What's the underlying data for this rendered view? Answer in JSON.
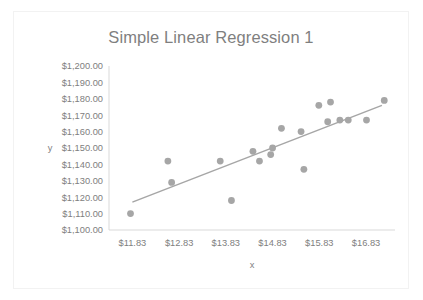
{
  "chart_data": {
    "type": "scatter",
    "title": "Simple Linear Regression 1",
    "xlabel": "x",
    "ylabel": "y",
    "xlim": [
      11.33,
      17.45
    ],
    "ylim": [
      1100,
      1200
    ],
    "grid": false,
    "legend": null,
    "x_tick_labels": [
      "$11.83",
      "$12.83",
      "$13.83",
      "$14.83",
      "$15.83",
      "$16.83"
    ],
    "x_tick_values": [
      11.83,
      12.83,
      13.83,
      14.83,
      15.83,
      16.83
    ],
    "y_tick_labels": [
      "$1,200.00",
      "$1,190.00",
      "$1,180.00",
      "$1,170.00",
      "$1,160.00",
      "$1,150.00",
      "$1,140.00",
      "$1,130.00",
      "$1,120.00",
      "$1,110.00",
      "$1,100.00"
    ],
    "y_tick_values": [
      1200,
      1190,
      1180,
      1170,
      1160,
      1150,
      1140,
      1130,
      1120,
      1110,
      1100
    ],
    "series": [
      {
        "name": "y",
        "marker_color": "#a6a6a6",
        "points": [
          {
            "x": 11.79,
            "y": 1110
          },
          {
            "x": 12.59,
            "y": 1142
          },
          {
            "x": 12.67,
            "y": 1129
          },
          {
            "x": 13.71,
            "y": 1142
          },
          {
            "x": 13.95,
            "y": 1118
          },
          {
            "x": 14.41,
            "y": 1148
          },
          {
            "x": 14.55,
            "y": 1142
          },
          {
            "x": 14.83,
            "y": 1150
          },
          {
            "x": 14.79,
            "y": 1146
          },
          {
            "x": 15.02,
            "y": 1162
          },
          {
            "x": 15.44,
            "y": 1160
          },
          {
            "x": 15.5,
            "y": 1137
          },
          {
            "x": 15.82,
            "y": 1176
          },
          {
            "x": 16.07,
            "y": 1178
          },
          {
            "x": 16.01,
            "y": 1166
          },
          {
            "x": 16.27,
            "y": 1167
          },
          {
            "x": 16.45,
            "y": 1167
          },
          {
            "x": 16.84,
            "y": 1167
          },
          {
            "x": 17.22,
            "y": 1179
          }
        ]
      }
    ],
    "trendline": {
      "type": "linear",
      "color": "#a6a6a6",
      "start": {
        "x": 11.83,
        "y": 1117
      },
      "end": {
        "x": 17.17,
        "y": 1176
      }
    }
  }
}
